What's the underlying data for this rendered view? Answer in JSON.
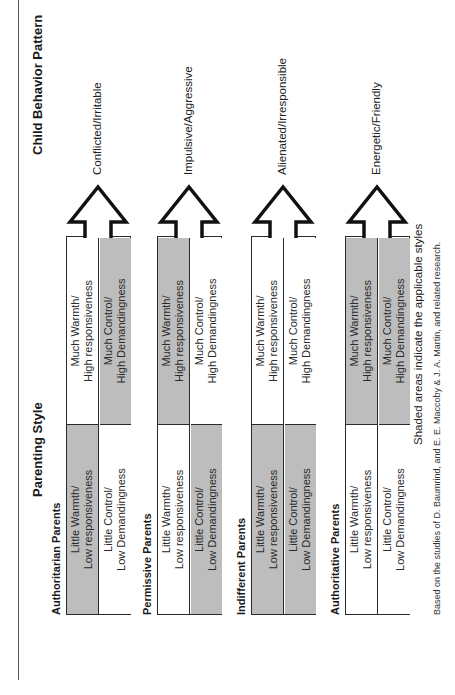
{
  "headings": {
    "parenting_style": "Parenting Style",
    "child_behavior_pattern": "Child Behavior Pattern"
  },
  "styles": [
    {
      "name": "Authoritarian Parents",
      "cells": {
        "low_warmth": {
          "text": "Little Warmth/\nLow responsiveness",
          "shaded": true
        },
        "high_warmth": {
          "text": "Much Warmth/\nHigh responsiveness",
          "shaded": false
        },
        "low_control": {
          "text": "Little Control/\nLow Demandingness",
          "shaded": false
        },
        "high_control": {
          "text": "Much Control/\nHigh Demandingness",
          "shaded": true
        }
      },
      "outcome": "Conflicted/Irritable"
    },
    {
      "name": "Permissive Parents",
      "cells": {
        "low_warmth": {
          "text": "Little Warmth/\nLow responsiveness",
          "shaded": false
        },
        "high_warmth": {
          "text": "Much Warmth/\nHigh responsiveness",
          "shaded": true
        },
        "low_control": {
          "text": "Little Control/\nLow Demandingness",
          "shaded": true
        },
        "high_control": {
          "text": "Much Control/\nHigh Demandingness",
          "shaded": false
        }
      },
      "outcome": "Impulsive/Aggressive"
    },
    {
      "name": "Indifferent Parents",
      "cells": {
        "low_warmth": {
          "text": "Little Warmth/\nLow responsiveness",
          "shaded": true
        },
        "high_warmth": {
          "text": "Much Warmth/\nHigh responsiveness",
          "shaded": false
        },
        "low_control": {
          "text": "Little Control/\nLow Demandingness",
          "shaded": true
        },
        "high_control": {
          "text": "Much Control/\nHigh Demandingness",
          "shaded": false
        }
      },
      "outcome": "Alienated/Irresponsible"
    },
    {
      "name": "Authoritative Parents",
      "cells": {
        "low_warmth": {
          "text": "Little Warmth/\nLow responsiveness",
          "shaded": false
        },
        "high_warmth": {
          "text": "Much Warmth/\nHigh responsiveness",
          "shaded": true
        },
        "low_control": {
          "text": "Little Control/\nLow Demandingness",
          "shaded": false
        },
        "high_control": {
          "text": "Much Control/\nHigh Demandingness",
          "shaded": true
        }
      },
      "outcome": "Energetic/Friendly"
    }
  ],
  "note": "Shaded areas indicate the applicable styles",
  "source": "Based on the studies of D. Baumrind, and E. E. Maccoby & J. A. Martin, and related research.",
  "colors": {
    "shade": "#bdbdbd",
    "line": "#2a2a2a"
  }
}
